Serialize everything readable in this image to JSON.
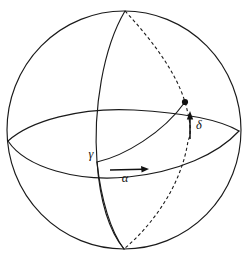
{
  "figure": {
    "name": "celestial-sphere-equatorial-coordinates",
    "background_color": "#ffffff",
    "line_color": "#1a1a1a",
    "width": 250,
    "height": 257
  },
  "labels": {
    "gamma": "γ",
    "alpha": "α",
    "delta": "δ"
  },
  "label_meanings": {
    "gamma": "vernal-equinox-point",
    "alpha": "right-ascension",
    "delta": "declination"
  },
  "geometry": {
    "sphere": {
      "center_x": 124,
      "center_y": 130,
      "radius": 119
    },
    "north_pole": {
      "x": 125,
      "y": 11
    },
    "south_pole": {
      "x": 124,
      "y": 249
    },
    "equator_left": {
      "x": 8,
      "y": 141
    },
    "equator_right": {
      "x": 239,
      "y": 131
    },
    "vernal_point": {
      "x": 97,
      "y": 162
    },
    "star_point": {
      "x": 185,
      "y": 102
    },
    "hour_circle_foot": {
      "x": 188,
      "y": 141
    }
  },
  "elements": {
    "sphere_outline": "circle",
    "equator": "solid-ellipse-arc",
    "prime_meridian": "solid-great-circle-through-gamma",
    "hour_circle": "dashed-great-circle-through-star",
    "object_arc": "solid-arc-from-gamma-to-star",
    "alpha_arrow": "horizontal-arrow-along-equator",
    "delta_arrow": "vertical-arrow-from-equator-to-star",
    "star_marker": "filled-dot"
  },
  "arrows": {
    "alpha": {
      "x1": 110,
      "y1": 170,
      "x2": 149,
      "y2": 169,
      "direction": "right"
    },
    "delta": {
      "x1": 190,
      "y1": 139,
      "x2": 190,
      "y2": 112,
      "direction": "up"
    }
  },
  "label_positions": {
    "gamma": {
      "x": 91,
      "y": 158
    },
    "alpha": {
      "x": 125,
      "y": 182
    },
    "delta": {
      "x": 196,
      "y": 129
    }
  }
}
